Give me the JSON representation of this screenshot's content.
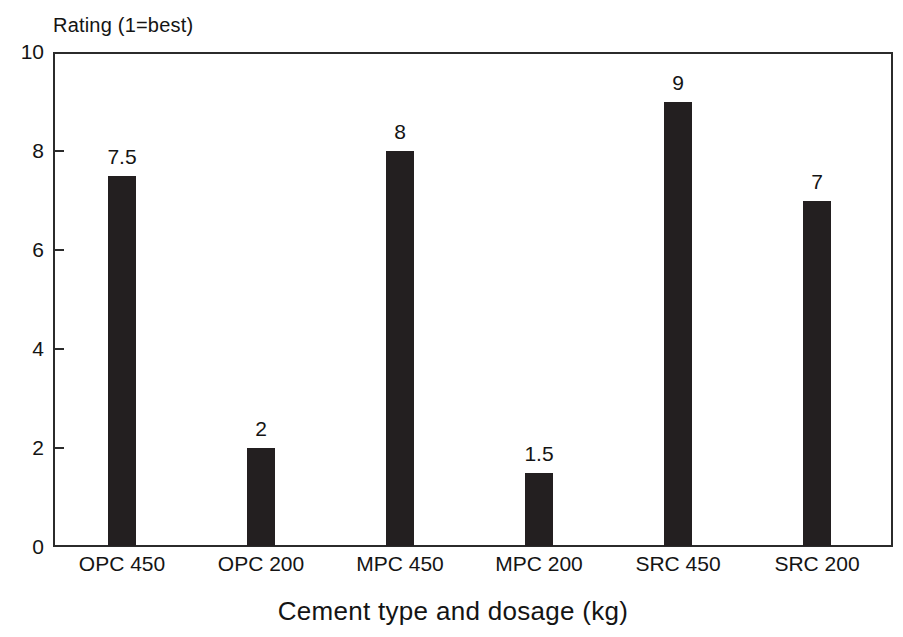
{
  "chart_data": {
    "type": "bar",
    "title": "",
    "categories": [
      "OPC 450",
      "OPC 200",
      "MPC 450",
      "MPC 200",
      "SRC 450",
      "SRC 200"
    ],
    "values": [
      7.5,
      2,
      8,
      1.5,
      9,
      7
    ],
    "value_labels": [
      "7.5",
      "2",
      "8",
      "1.5",
      "9",
      "7"
    ],
    "xlabel": "Cement type and dosage (kg)",
    "ylabel": "Rating (1=best)",
    "ylim": [
      0,
      10
    ],
    "yticks": [
      0,
      2,
      4,
      6,
      8,
      10
    ],
    "ytick_labels": [
      "0",
      "2",
      "4",
      "6",
      "8",
      "10"
    ],
    "grid": false,
    "legend": null,
    "bar_color": "#231f20",
    "axis_color": "#2b2b2b",
    "background_color": "#ffffff"
  }
}
